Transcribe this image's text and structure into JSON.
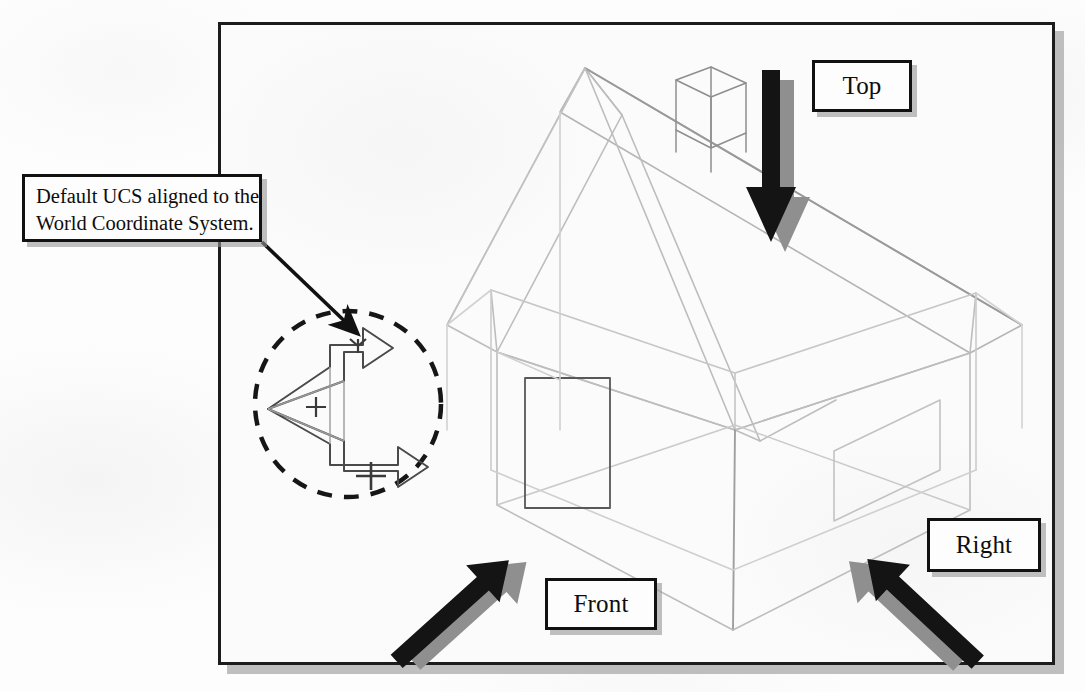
{
  "figure": {
    "kind": "isometric-wireframe-house-viewpoint-diagram",
    "frame": {
      "name": "drawing-frame"
    }
  },
  "callout": {
    "name": "default-ucs-callout",
    "line1": "Default UCS aligned to the",
    "line2": "World Coordinate System.",
    "leader": "leader-arrow"
  },
  "view_labels": [
    {
      "id": "top",
      "label": "Top",
      "arrow": "arrow-top-view",
      "direction": "down"
    },
    {
      "id": "front",
      "label": "Front",
      "arrow": "arrow-front-view",
      "direction": "up-right"
    },
    {
      "id": "right",
      "label": "Right",
      "arrow": "arrow-right-view",
      "direction": "up-left"
    }
  ],
  "ucs_icon": {
    "name": "ucs-icon",
    "x_axis_label": "X",
    "y_axis_label": "Y",
    "origin_mark": "+",
    "highlight": "dashed-circle"
  },
  "model": {
    "name": "wireframe-house",
    "parts": [
      "roof-left-plane",
      "roof-right-plane",
      "ridge-line",
      "chimney",
      "wall-front-left",
      "wall-front-right",
      "floor-plane",
      "door-rectangle",
      "window-parallelogram"
    ]
  },
  "colors": {
    "ink": "#111111",
    "wireframe": "#b9b9b9",
    "wireframe_dark": "#6e6e6e",
    "arrow_black": "#111111",
    "arrow_shadow": "#8f8f8f",
    "box_shadow": "#969696",
    "paper": "#fdfdfd"
  }
}
